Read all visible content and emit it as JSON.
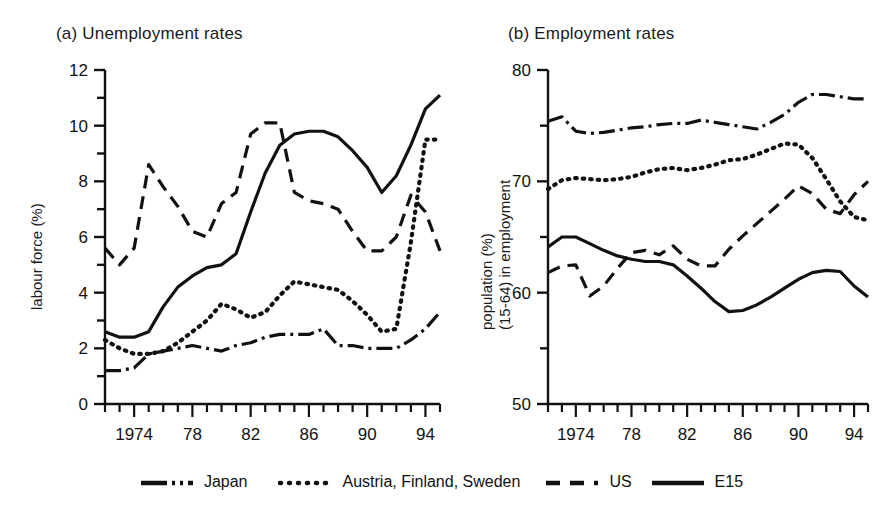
{
  "figure": {
    "background": "#ffffff",
    "ink": "#111111"
  },
  "panels": {
    "a": {
      "title": "(a) Unemployment rates",
      "ylabel": "labour force (%)"
    },
    "b": {
      "title": "(b) Employment rates",
      "ylabel_line1": "population (%)",
      "ylabel_line2": "(15-64) in employment"
    }
  },
  "legend": {
    "items": [
      {
        "label": "Japan",
        "style": "dashdot",
        "key": "legend-key-japan"
      },
      {
        "label": "Austria, Finland, Sweden",
        "style": "dotted",
        "key": "legend-key-nordic"
      },
      {
        "label": "US",
        "style": "dashed",
        "key": "legend-key-us"
      },
      {
        "label": "E15",
        "style": "solid",
        "key": "legend-key-e15"
      }
    ]
  },
  "chart_data": [
    {
      "id": "panel-a",
      "type": "line",
      "title": "(a) Unemployment rates",
      "xlabel": "",
      "ylabel": "labour force (%)",
      "xlim": [
        1972,
        1995
      ],
      "ylim": [
        0,
        12
      ],
      "ytick_values": [
        0,
        2,
        4,
        6,
        8,
        10,
        12
      ],
      "ytick_labels": [
        "0",
        "2",
        "4",
        "6",
        "8",
        "10",
        "12"
      ],
      "yminor_step": 1,
      "xtick_values": [
        1972,
        1973,
        1974,
        1975,
        1976,
        1977,
        1978,
        1979,
        1980,
        1981,
        1982,
        1983,
        1984,
        1985,
        1986,
        1987,
        1988,
        1989,
        1990,
        1991,
        1992,
        1993,
        1994,
        1995
      ],
      "xtick_labeled": [
        1974,
        1978,
        1982,
        1986,
        1990,
        1994
      ],
      "xtick_labels": [
        "1974",
        "78",
        "82",
        "86",
        "90",
        "94"
      ],
      "grid": false,
      "legend_position": "below-figure",
      "x": [
        1972,
        1973,
        1974,
        1975,
        1976,
        1977,
        1978,
        1979,
        1980,
        1981,
        1982,
        1983,
        1984,
        1985,
        1986,
        1987,
        1988,
        1989,
        1990,
        1991,
        1992,
        1993,
        1994,
        1995
      ],
      "series": [
        {
          "name": "Japan",
          "style": "dashdot",
          "values": [
            1.2,
            1.2,
            1.3,
            1.8,
            1.9,
            2.0,
            2.1,
            2.0,
            1.9,
            2.1,
            2.2,
            2.4,
            2.5,
            2.5,
            2.5,
            2.7,
            2.1,
            2.1,
            2.0,
            2.0,
            2.0,
            2.3,
            2.7,
            3.3
          ]
        },
        {
          "name": "Austria, Finland, Sweden",
          "style": "dotted",
          "values": [
            2.3,
            2.0,
            1.8,
            1.8,
            1.9,
            2.2,
            2.6,
            3.0,
            3.6,
            3.4,
            3.1,
            3.3,
            3.9,
            4.4,
            4.3,
            4.2,
            4.1,
            3.7,
            3.2,
            2.6,
            2.7,
            5.8,
            9.5,
            9.5
          ]
        },
        {
          "name": "US",
          "style": "dashed",
          "values": [
            5.6,
            5.0,
            5.6,
            8.6,
            7.8,
            7.1,
            6.2,
            6.0,
            7.2,
            7.6,
            9.7,
            10.1,
            10.1,
            7.6,
            7.3,
            7.2,
            7.0,
            6.2,
            5.5,
            5.5,
            6.0,
            7.5,
            6.9,
            5.5
          ]
        },
        {
          "name": "E15",
          "style": "solid",
          "values": [
            2.6,
            2.4,
            2.4,
            2.6,
            3.5,
            4.2,
            4.6,
            4.9,
            5.0,
            5.4,
            6.9,
            8.3,
            9.3,
            9.7,
            9.8,
            9.8,
            9.6,
            9.1,
            8.5,
            7.6,
            8.2,
            9.3,
            10.6,
            11.1,
            11.1
          ]
        }
      ]
    },
    {
      "id": "panel-b",
      "type": "line",
      "title": "(b) Employment rates",
      "xlabel": "",
      "ylabel": "population (%) (15-64) in employment",
      "xlim": [
        1972,
        1995
      ],
      "ylim": [
        50,
        80
      ],
      "ytick_values": [
        50,
        55,
        60,
        65,
        70,
        75,
        80
      ],
      "ytick_labels": [
        "50",
        "",
        "60",
        "",
        "70",
        "",
        "80"
      ],
      "yminor_step": 5,
      "xtick_values": [
        1972,
        1973,
        1974,
        1975,
        1976,
        1977,
        1978,
        1979,
        1980,
        1981,
        1982,
        1983,
        1984,
        1985,
        1986,
        1987,
        1988,
        1989,
        1990,
        1991,
        1992,
        1993,
        1994,
        1995
      ],
      "xtick_labeled": [
        1974,
        1978,
        1982,
        1986,
        1990,
        1994
      ],
      "xtick_labels": [
        "1974",
        "78",
        "82",
        "86",
        "90",
        "94"
      ],
      "grid": false,
      "legend_position": "below-figure",
      "x": [
        1972,
        1973,
        1974,
        1975,
        1976,
        1977,
        1978,
        1979,
        1980,
        1981,
        1982,
        1983,
        1984,
        1985,
        1986,
        1987,
        1988,
        1989,
        1990,
        1991,
        1992,
        1993,
        1994,
        1995
      ],
      "series": [
        {
          "name": "Japan",
          "style": "dashdot",
          "values": [
            75.4,
            75.8,
            74.5,
            74.3,
            74.4,
            74.6,
            74.8,
            74.9,
            75.1,
            75.2,
            75.2,
            75.5,
            75.3,
            75.1,
            74.9,
            74.7,
            75.3,
            76.0,
            77.1,
            77.8,
            77.8,
            77.6,
            77.4,
            77.4
          ]
        },
        {
          "name": "Austria, Finland, Sweden",
          "style": "dotted",
          "values": [
            69.3,
            70.1,
            70.3,
            70.2,
            70.1,
            70.2,
            70.4,
            70.8,
            71.1,
            71.2,
            71.0,
            71.2,
            71.5,
            71.9,
            72.0,
            72.4,
            72.9,
            73.4,
            73.3,
            72.1,
            70.2,
            68.2,
            66.8,
            66.5
          ]
        },
        {
          "name": "US",
          "style": "dashed",
          "values": [
            61.8,
            62.4,
            62.5,
            59.7,
            60.6,
            62.2,
            63.6,
            63.8,
            63.4,
            64.2,
            63.0,
            62.4,
            62.4,
            63.9,
            65.1,
            66.2,
            67.3,
            68.4,
            69.6,
            68.9,
            67.5,
            67.1,
            68.8,
            70.0
          ]
        },
        {
          "name": "E15",
          "style": "solid",
          "values": [
            64.1,
            65.0,
            65.0,
            64.4,
            63.8,
            63.3,
            63.0,
            62.8,
            62.8,
            62.5,
            61.5,
            60.4,
            59.2,
            58.3,
            58.4,
            58.9,
            59.6,
            60.4,
            61.2,
            61.8,
            62.0,
            61.9,
            60.6,
            59.6
          ]
        }
      ]
    }
  ]
}
